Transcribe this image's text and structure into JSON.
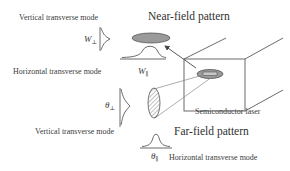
{
  "diagram": {
    "title_near": "Near-field pattern",
    "title_far": "Far-field pattern",
    "laser_label": "Semiconductor laser",
    "near_field": {
      "vertical_mode_label": "Vertical transverse mode",
      "horizontal_mode_label": "Horizontal transverse mode",
      "vertical_symbol": "W",
      "vertical_subscript": "⊥",
      "horizontal_symbol": "W",
      "horizontal_subscript": "∥"
    },
    "far_field": {
      "vertical_mode_label": "Vertical transverse mode",
      "horizontal_mode_label": "Horizontal transverse mode",
      "vertical_symbol": "θ",
      "vertical_subscript": "⊥",
      "horizontal_symbol": "θ",
      "horizontal_subscript": "∥"
    },
    "colors": {
      "line": "#5a5a5a",
      "ellipse_fill": "#9a9a9a",
      "text": "#3a3a3a"
    }
  }
}
